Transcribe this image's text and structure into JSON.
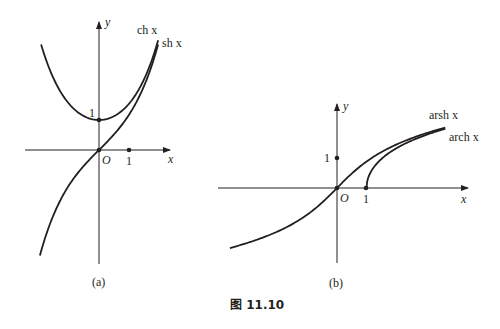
{
  "figure": {
    "caption": "图 11.10",
    "panels": [
      {
        "id": "a",
        "label": "(a)",
        "x_axis_label": "x",
        "y_axis_label": "y",
        "origin_label": "O",
        "tick_x": "1",
        "tick_y": "1",
        "curves": [
          {
            "name": "ch x",
            "func": "cosh"
          },
          {
            "name": "sh x",
            "func": "sinh"
          }
        ]
      },
      {
        "id": "b",
        "label": "(b)",
        "x_axis_label": "x",
        "y_axis_label": "y",
        "origin_label": "O",
        "tick_x": "1",
        "tick_y": "1",
        "curves": [
          {
            "name": "arsh x",
            "func": "arsinh"
          },
          {
            "name": "arch x",
            "func": "arcosh"
          }
        ]
      }
    ]
  },
  "chart_data": [
    {
      "type": "line",
      "title": "(a)",
      "xlabel": "x",
      "ylabel": "y",
      "xlim": [
        -2.5,
        2.4
      ],
      "ylim": [
        -3.8,
        4.3
      ],
      "grid": false,
      "x": [
        -1.93,
        -1.5,
        -1.0,
        -0.5,
        0,
        0.5,
        1.0,
        1.5,
        1.97
      ],
      "series": [
        {
          "name": "ch x",
          "values": [
            3.51,
            2.35,
            1.54,
            1.13,
            1.0,
            1.13,
            1.54,
            2.35,
            3.65
          ]
        },
        {
          "name": "sh x",
          "values": [
            -3.37,
            -2.13,
            -1.18,
            -0.52,
            0,
            0.52,
            1.18,
            2.13,
            3.52
          ]
        }
      ],
      "annotations": [
        "O",
        "1 (on x-axis)",
        "1 (on y-axis)"
      ]
    },
    {
      "type": "line",
      "title": "(b)",
      "xlabel": "x",
      "ylabel": "y",
      "xlim": [
        -4.0,
        4.3
      ],
      "ylim": [
        -2.5,
        2.8
      ],
      "grid": false,
      "x": [
        -3.57,
        -3,
        -2,
        -1,
        0,
        1,
        2,
        3,
        3.6
      ],
      "series": [
        {
          "name": "arsh x",
          "values": [
            -1.98,
            -1.82,
            -1.44,
            -0.88,
            0,
            0.88,
            1.44,
            1.82,
            1.99
          ]
        },
        {
          "name": "arch x",
          "values": [
            null,
            null,
            null,
            null,
            null,
            0,
            1.32,
            1.76,
            1.95
          ]
        }
      ],
      "annotations": [
        "O",
        "1 (on x-axis)",
        "1 (on y-axis)"
      ]
    }
  ]
}
